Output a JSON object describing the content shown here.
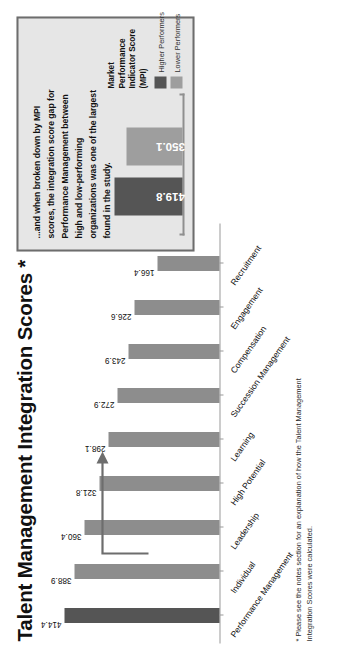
{
  "title": "Talent Management Integration Scores *",
  "footnote": "* Please see the notes section for an explanation of how the Talent Management Integration Scores were calculated.",
  "colors": {
    "accent_bar": "#555555",
    "standard_bar": "#8d8d8d",
    "inset_high": "#555555",
    "inset_low": "#9e9e9e",
    "inset_background": "#e6e6e6",
    "inset_border": "#6d6d6d",
    "axis": "#9a9a9a"
  },
  "inset": {
    "body_text": "...and when broken down by MPI scores, the integration score gap for Performance Management between high and low-performing organizations was one of the largest found in the study.",
    "legend": {
      "title": "Market Performance Indicator Score (MPI)",
      "items": [
        {
          "label": "Higher Performers",
          "color": "#555555"
        },
        {
          "label": "Lower Performers",
          "color": "#9e9e9e"
        }
      ]
    }
  },
  "chart_data": [
    {
      "type": "bar",
      "title": "Talent Management Integration Scores *",
      "xlabel": "",
      "ylabel": "",
      "ylim": [
        0,
        460
      ],
      "grid": false,
      "legend": "none",
      "categories": [
        "Performance Management",
        "Individual",
        "Leadership",
        "High Potential",
        "Learning",
        "Succession Management",
        "Compensation",
        "Engagement",
        "Recruitment"
      ],
      "values": [
        414.4,
        388.9,
        360.4,
        321.8,
        298.1,
        272.9,
        243.9,
        226.6,
        166.4
      ],
      "highlight_index": 0
    },
    {
      "type": "bar",
      "title": "Market Performance Indicator Score (MPI)",
      "xlabel": "",
      "ylabel": "",
      "ylim": [
        0,
        460
      ],
      "grid": false,
      "legend": "right",
      "categories": [
        "Higher Performers",
        "Lower Performers"
      ],
      "values": [
        419.8,
        350.1
      ]
    }
  ]
}
